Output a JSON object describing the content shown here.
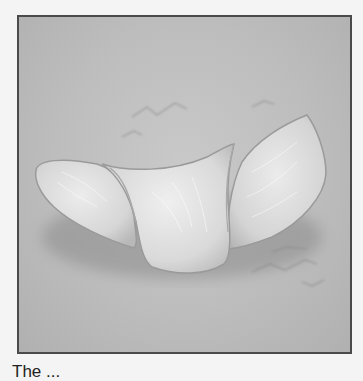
{
  "figure": {
    "colors": {
      "background": "#f4f4f4",
      "frame_border": "#4a4a4a",
      "surface": "#bdbdbd",
      "tissue_light": "#e8e8e8",
      "tissue_mid": "#d2d2d2",
      "tissue_edge": "#9a9a9a",
      "shadow": "#7a7a7a"
    }
  },
  "caption": {
    "text": "The ..."
  }
}
